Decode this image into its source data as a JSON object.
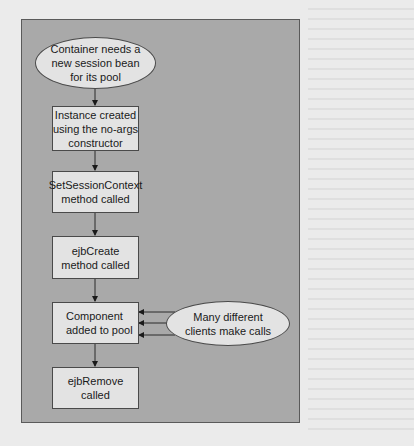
{
  "diagram": {
    "type": "flowchart",
    "nodes": [
      {
        "id": "start",
        "shape": "ellipse",
        "label": "Container needs a\nnew session bean\nfor its pool"
      },
      {
        "id": "instance",
        "shape": "box",
        "label": "Instance created\nusing the no-args\nconstructor"
      },
      {
        "id": "setctx",
        "shape": "box",
        "label": "SetSessionContext\nmethod called"
      },
      {
        "id": "create",
        "shape": "box",
        "label": "ejbCreate\nmethod called"
      },
      {
        "id": "pool",
        "shape": "box",
        "label": "Component\nadded to pool"
      },
      {
        "id": "remove",
        "shape": "box",
        "label": "ejbRemove\ncalled"
      },
      {
        "id": "clients",
        "shape": "ellipse",
        "label": "Many different\nclients make calls"
      }
    ],
    "edges": [
      {
        "from": "start",
        "to": "instance"
      },
      {
        "from": "instance",
        "to": "setctx"
      },
      {
        "from": "setctx",
        "to": "create"
      },
      {
        "from": "create",
        "to": "pool"
      },
      {
        "from": "pool",
        "to": "remove"
      },
      {
        "from": "clients",
        "to": "pool",
        "count": 3
      }
    ],
    "colors": {
      "page_background": "#ebebeb",
      "panel_background": "#a9a9a9",
      "node_fill": "#e3e3e3",
      "stroke": "#2a2a2a"
    }
  }
}
